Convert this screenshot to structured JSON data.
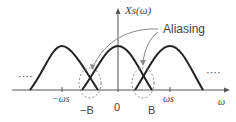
{
  "diagram": {
    "y_axis_label": "Xs(ω)",
    "x_axis_label": "ω",
    "annotation": "Aliasing",
    "ticks": {
      "neg_ws": "−ωs",
      "neg_b": "−B",
      "zero": "0",
      "b": "B",
      "ws": "ωs"
    },
    "ellipsis_left": "····",
    "ellipsis_right": "····",
    "colors": {
      "curve": "#222222",
      "axis": "#555555",
      "dashed": "#888888",
      "text": "#444444"
    }
  }
}
